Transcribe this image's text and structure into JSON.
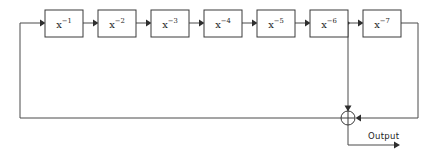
{
  "diagram": {
    "type": "block-diagram",
    "title": "",
    "canvas": {
      "width": 431,
      "height": 155,
      "background": "#ffffff"
    },
    "colors": {
      "line": "#4a4a4a",
      "box_stroke": "#3a3a3a",
      "box_fill": "#ffffff",
      "text": "#1c1c1c",
      "arrow": "#2e2e2e"
    },
    "blocks": [
      {
        "id": "b1",
        "base": "x",
        "exponent": "−1",
        "label": "x⁻¹",
        "x": 45,
        "y": 10,
        "w": 38,
        "h": 27
      },
      {
        "id": "b2",
        "base": "x",
        "exponent": "−2",
        "label": "x⁻²",
        "x": 98,
        "y": 10,
        "w": 38,
        "h": 27
      },
      {
        "id": "b3",
        "base": "x",
        "exponent": "−3",
        "label": "x⁻³",
        "x": 151,
        "y": 10,
        "w": 38,
        "h": 27
      },
      {
        "id": "b4",
        "base": "x",
        "exponent": "−4",
        "label": "x⁻⁴",
        "x": 204,
        "y": 10,
        "w": 38,
        "h": 27
      },
      {
        "id": "b5",
        "base": "x",
        "exponent": "−5",
        "label": "x⁻⁵",
        "x": 257,
        "y": 10,
        "w": 38,
        "h": 27
      },
      {
        "id": "b6",
        "base": "x",
        "exponent": "−6",
        "label": "x⁻⁶",
        "x": 310,
        "y": 10,
        "w": 38,
        "h": 27
      },
      {
        "id": "b7",
        "base": "x",
        "exponent": "−7",
        "label": "x⁻⁷",
        "x": 363,
        "y": 10,
        "w": 38,
        "h": 27
      }
    ],
    "junction": {
      "name": "summing-junction",
      "symbol": "⊕",
      "cx": 348,
      "cy": 118,
      "r": 7
    },
    "tap_node": {
      "name": "tap-node",
      "cx": 348,
      "cy": 23
    },
    "output": {
      "label": "Output",
      "label_x": 368,
      "label_y": 136,
      "arrow_y": 145,
      "arrow_x": 400
    },
    "feedback_path": {
      "description": "summing junction output loops back to first block input",
      "left_x": 20,
      "bottom_y": 118,
      "top_y": 23
    },
    "signal_flow": [
      "x⁻¹",
      "x⁻²",
      "x⁻³",
      "x⁻⁴",
      "x⁻⁵",
      "x⁻⁶",
      "x⁻⁷"
    ]
  }
}
